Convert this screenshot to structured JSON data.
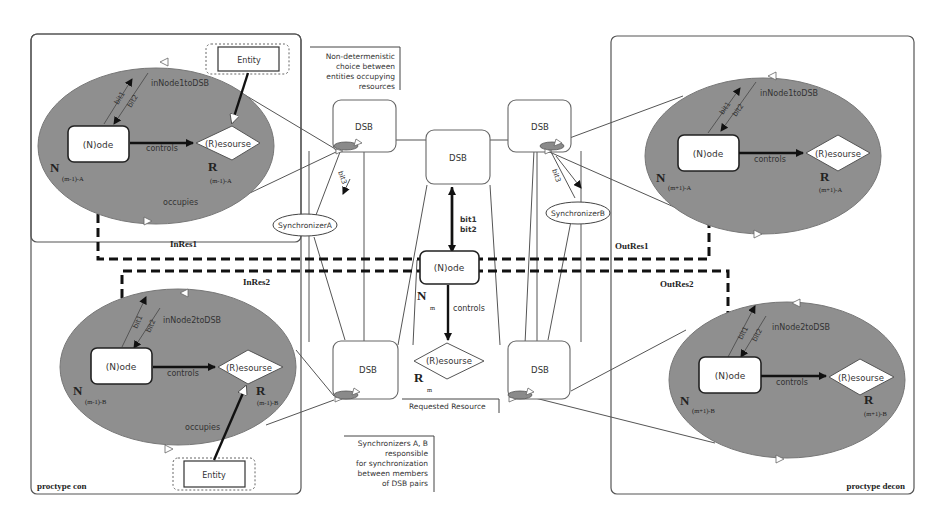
{
  "diagram": {
    "processes": {
      "left": {
        "label": "proctype con"
      },
      "right": {
        "label": "proctype decon"
      }
    },
    "clusters": [
      {
        "id": "left-top",
        "node_label": "(N)ode",
        "resource_label": "(R)esourse",
        "controls_label": "controls",
        "channel_label": "inNode1toDSB",
        "bit1": "bit1",
        "bit2": "bit2",
        "occupies_label": "occupies",
        "entity_label": "Entity",
        "N": "N",
        "N_sub": "(m-1)-A",
        "R": "R",
        "R_sub": "(m-1)-A"
      },
      {
        "id": "left-bottom",
        "node_label": "(N)ode",
        "resource_label": "(R)esourse",
        "controls_label": "controls",
        "channel_label": "inNode2toDSB",
        "bit1": "bit1",
        "bit2": "bit2",
        "occupies_label": "occupies",
        "entity_label": "Entity",
        "N": "N",
        "N_sub": "(m-1)-B",
        "R": "R",
        "R_sub": "(m-1)-B"
      },
      {
        "id": "right-top",
        "node_label": "(N)ode",
        "resource_label": "(R)esourse",
        "controls_label": "controls",
        "channel_label": "inNode1toDSB",
        "bit1": "bit1",
        "bit2": "bit2",
        "N": "N",
        "N_sub": "(m+1)-A",
        "R": "R",
        "R_sub": "(m+1)-A"
      },
      {
        "id": "right-bottom",
        "node_label": "(N)ode",
        "resource_label": "(R)esourse",
        "controls_label": "controls",
        "channel_label": "inNode2toDSB",
        "bit1": "bit1",
        "bit2": "bit2",
        "N": "N",
        "N_sub": "(m+1)-B",
        "R": "R",
        "R_sub": "(m+1)-B"
      }
    ],
    "center": {
      "node_label": "(N)ode",
      "resource_label": "(R)esourse",
      "controls_label": "controls",
      "bit1": "bit1",
      "bit2": "bit2",
      "N": "N",
      "N_sub": "m",
      "R": "R",
      "R_sub": "m",
      "requested_label": "Requested Resource"
    },
    "dsb_label": "DSB",
    "synchronizers": {
      "a": {
        "label": "SynchronizerA",
        "bit_label": "bit3"
      },
      "b": {
        "label": "SynchronizerB",
        "bit_label": "bit3"
      }
    },
    "dashed_paths": {
      "in_res1": "InRes1",
      "in_res2": "InRes2",
      "out_res1": "OutRes1",
      "out_res2": "OutRes2"
    },
    "notes": {
      "top": [
        "Non-determenistic",
        "choice between",
        "entities occupying",
        "resources"
      ],
      "bottom": [
        "Synchronizers A, B",
        "responsible",
        "for synchronization",
        "between members",
        "of DSB pairs"
      ]
    }
  }
}
